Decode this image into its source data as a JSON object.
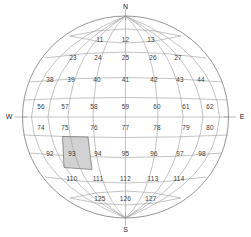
{
  "diagram": {
    "type": "globe-grid",
    "highlighted_cell": "93",
    "highlight_color": "#d2d2d2",
    "line_color": "#9a9a9a",
    "outline_color": "#7a7a7a",
    "label_color": "#3a3a3a",
    "background": "#ffffff"
  },
  "compass": {
    "north": "N",
    "east": "E",
    "south": "S",
    "west": "W"
  },
  "grid": {
    "rows": [
      {
        "band": 1,
        "cells": [
          "11",
          "12",
          "13"
        ]
      },
      {
        "band": 2,
        "cells": [
          "23",
          "24",
          "25",
          "26",
          "27"
        ]
      },
      {
        "band": 3,
        "cells": [
          "38",
          "39",
          "40",
          "41",
          "42",
          "43",
          "44"
        ]
      },
      {
        "band": 4,
        "cells": [
          "56",
          "57",
          "58",
          "59",
          "60",
          "61",
          "62"
        ]
      },
      {
        "band": 5,
        "cells": [
          "74",
          "75",
          "76",
          "77",
          "78",
          "79",
          "80"
        ]
      },
      {
        "band": 6,
        "cells": [
          "92",
          "93",
          "94",
          "95",
          "96",
          "97",
          "98"
        ]
      },
      {
        "band": 7,
        "cells": [
          "110",
          "111",
          "112",
          "113",
          "114"
        ]
      },
      {
        "band": 8,
        "cells": [
          "125",
          "126",
          "127"
        ]
      }
    ]
  },
  "cell_labels": {
    "c11": "11",
    "c12": "12",
    "c13": "13",
    "c23": "23",
    "c24": "24",
    "c25": "25",
    "c26": "26",
    "c27": "27",
    "c38": "38",
    "c39": "39",
    "c40": "40",
    "c41": "41",
    "c42": "42",
    "c43": "43",
    "c44": "44",
    "c56": "56",
    "c57": "57",
    "c58": "58",
    "c59": "59",
    "c60": "60",
    "c61": "61",
    "c62": "62",
    "c74": "74",
    "c75": "75",
    "c76": "76",
    "c77": "77",
    "c78": "78",
    "c79": "79",
    "c80": "80",
    "c92": "92",
    "c93": "93",
    "c94": "94",
    "c95": "95",
    "c96": "96",
    "c97": "97",
    "c98": "98",
    "c110": "110",
    "c111": "111",
    "c112": "112",
    "c113": "113",
    "c114": "114",
    "c125": "125",
    "c126": "126",
    "c127": "127"
  }
}
